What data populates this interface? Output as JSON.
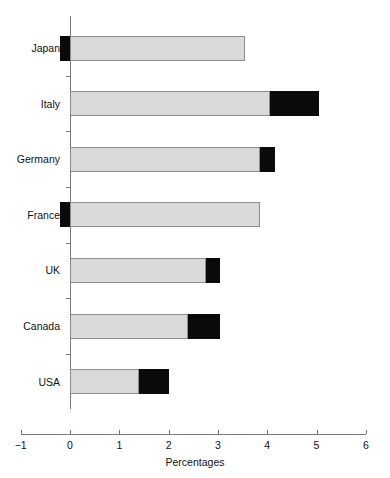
{
  "chart_data": {
    "type": "bar",
    "orientation": "horizontal",
    "stacked": true,
    "title": "",
    "xlabel": "Percentages",
    "ylabel": "",
    "xlim": [
      -1,
      6
    ],
    "xticks": [
      -1,
      0,
      1,
      2,
      3,
      4,
      5,
      6
    ],
    "xticklabels": [
      "−1",
      "0",
      "1",
      "2",
      "3",
      "4",
      "5",
      "6"
    ],
    "grid": false,
    "legend": null,
    "categories": [
      "Japan",
      "Italy",
      "Germany",
      "France",
      "UK",
      "Canada",
      "USA"
    ],
    "series": [
      {
        "name": "grey",
        "color": "#d9d9d9",
        "values": [
          3.55,
          4.05,
          3.85,
          3.85,
          2.75,
          2.4,
          1.4
        ]
      },
      {
        "name": "black",
        "color": "#0a0a0a",
        "values": [
          -0.2,
          1.0,
          0.3,
          -0.2,
          0.3,
          0.65,
          0.6
        ]
      }
    ],
    "segments": [
      {
        "category": "Japan",
        "parts": [
          {
            "series": "black",
            "start": -0.2,
            "end": 0.0
          },
          {
            "series": "grey",
            "start": 0.0,
            "end": 3.55
          }
        ]
      },
      {
        "category": "Italy",
        "parts": [
          {
            "series": "grey",
            "start": 0.0,
            "end": 4.05
          },
          {
            "series": "black",
            "start": 4.05,
            "end": 5.05
          }
        ]
      },
      {
        "category": "Germany",
        "parts": [
          {
            "series": "grey",
            "start": 0.0,
            "end": 3.85
          },
          {
            "series": "black",
            "start": 3.85,
            "end": 4.15
          }
        ]
      },
      {
        "category": "France",
        "parts": [
          {
            "series": "black",
            "start": -0.2,
            "end": 0.0
          },
          {
            "series": "grey",
            "start": 0.0,
            "end": 3.85
          }
        ]
      },
      {
        "category": "UK",
        "parts": [
          {
            "series": "grey",
            "start": 0.0,
            "end": 2.75
          },
          {
            "series": "black",
            "start": 2.75,
            "end": 3.05
          }
        ]
      },
      {
        "category": "Canada",
        "parts": [
          {
            "series": "grey",
            "start": 0.0,
            "end": 2.4
          },
          {
            "series": "black",
            "start": 2.4,
            "end": 3.05
          }
        ]
      },
      {
        "category": "USA",
        "parts": [
          {
            "series": "grey",
            "start": 0.0,
            "end": 1.4
          },
          {
            "series": "black",
            "start": 1.4,
            "end": 2.0
          }
        ]
      }
    ]
  },
  "axis": {
    "x_label": "Percentages"
  }
}
